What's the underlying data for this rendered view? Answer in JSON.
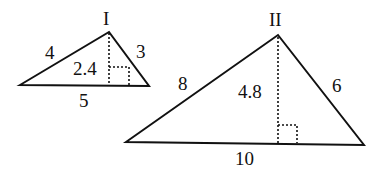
{
  "diagram": {
    "triangles": [
      {
        "id": "I",
        "label": "I",
        "sides": {
          "left": "4",
          "right": "3",
          "base": "5"
        },
        "height": "2.4"
      },
      {
        "id": "II",
        "label": "II",
        "sides": {
          "left": "8",
          "right": "6",
          "base": "10"
        },
        "height": "4.8"
      }
    ]
  }
}
